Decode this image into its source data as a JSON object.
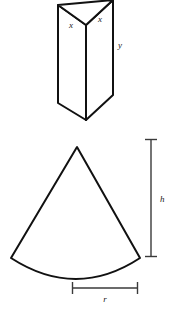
{
  "page": {
    "background_color": "#ffffff",
    "width": 174,
    "height": 314
  },
  "figures": [
    {
      "id": "triangular-prism",
      "name": "Triangular prism",
      "description": "A vertical triangular prism drawn in oblique perspective with its top triangular face visible.",
      "stroke_color": "#111111",
      "fill_color": "#ffffff",
      "labels": [
        {
          "id": "prism-edge-x-left",
          "text": "x",
          "style": "italic",
          "x": 71,
          "y": 28
        },
        {
          "id": "prism-edge-x-right",
          "text": "x",
          "style": "italic",
          "x": 100,
          "y": 22
        },
        {
          "id": "prism-height-y",
          "text": "y",
          "style": "italic",
          "x": 120,
          "y": 48
        }
      ],
      "geometry": {
        "top_back_left": [
          58,
          5
        ],
        "top_back_right": [
          113,
          0
        ],
        "top_front": [
          86,
          25
        ],
        "bottom_left": [
          58,
          103
        ],
        "bottom_right": [
          113,
          95
        ],
        "bottom_front": [
          86,
          120
        ]
      }
    },
    {
      "id": "cone-net-sector",
      "name": "Circular sector (cone lateral surface net)",
      "description": "A circular sector with a concave lower arc, representing the unrolled lateral surface of a cone.",
      "stroke_color": "#111111",
      "fill_color": "#ffffff",
      "geometry": {
        "apex": [
          77,
          147
        ],
        "corner_left": [
          11,
          258
        ],
        "corner_right": [
          140,
          258
        ],
        "arc_sag_point": [
          76,
          282
        ]
      }
    }
  ],
  "dimensions": [
    {
      "id": "height-dimension",
      "name": "Height dimension line",
      "label": "h",
      "style": "italic",
      "orientation": "vertical",
      "color": "#3a3a3a",
      "from": [
        151,
        139
      ],
      "to": [
        151,
        257
      ],
      "cap_half_length": 6,
      "label_position": [
        158,
        202
      ]
    },
    {
      "id": "radius-dimension",
      "name": "Radius dimension line",
      "label": "r",
      "style": "italic",
      "orientation": "horizontal",
      "color": "#3a3a3a",
      "from": [
        72,
        288
      ],
      "to": [
        138,
        288
      ],
      "cap_half_length": 6,
      "label_position": [
        105,
        301
      ]
    }
  ]
}
